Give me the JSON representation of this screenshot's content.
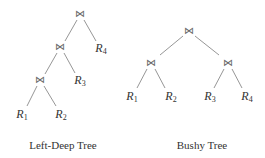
{
  "join_symbol": "⋈",
  "left_deep": {
    "caption": "Left-Deep Tree",
    "joins": [
      {
        "id": "j1",
        "x": 80,
        "y": 14
      },
      {
        "id": "j2",
        "x": 60,
        "y": 47
      },
      {
        "id": "j3",
        "x": 40,
        "y": 80
      }
    ],
    "leaves": [
      {
        "name": "R",
        "sub": "4",
        "x": 101,
        "y": 49
      },
      {
        "name": "R",
        "sub": "3",
        "x": 80,
        "y": 81
      },
      {
        "name": "R",
        "sub": "1",
        "x": 22,
        "y": 115
      },
      {
        "name": "R",
        "sub": "2",
        "x": 61,
        "y": 115
      }
    ]
  },
  "bushy": {
    "caption": "Bushy Tree",
    "joins": [
      {
        "id": "b1",
        "x": 189,
        "y": 31
      },
      {
        "id": "b2",
        "x": 151,
        "y": 63
      },
      {
        "id": "b3",
        "x": 228,
        "y": 63
      }
    ],
    "leaves": [
      {
        "name": "R",
        "sub": "1",
        "x": 132,
        "y": 97
      },
      {
        "name": "R",
        "sub": "2",
        "x": 171,
        "y": 97
      },
      {
        "name": "R",
        "sub": "3",
        "x": 210,
        "y": 97
      },
      {
        "name": "R",
        "sub": "4",
        "x": 247,
        "y": 97
      }
    ]
  }
}
